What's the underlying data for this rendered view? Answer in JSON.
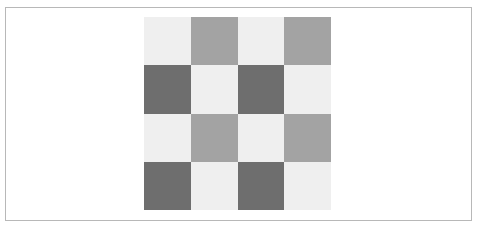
{
  "pattern": {
    "rows": 4,
    "cols": 4,
    "colors": {
      "light": "#efefef",
      "mid": "#a3a3a3",
      "dark": "#6e6e6e"
    },
    "cells": [
      [
        "light",
        "mid",
        "light",
        "mid"
      ],
      [
        "dark",
        "light",
        "dark",
        "light"
      ],
      [
        "light",
        "mid",
        "light",
        "mid"
      ],
      [
        "dark",
        "light",
        "dark",
        "light"
      ]
    ]
  }
}
